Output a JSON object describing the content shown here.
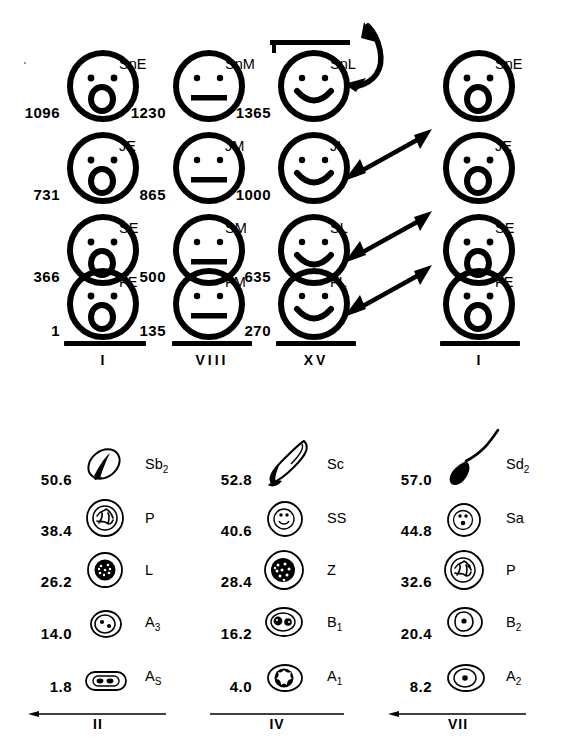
{
  "figure": {
    "top_panel": {
      "columns": [
        {
          "stage_label": "I",
          "face_style": "surprised",
          "rows": [
            {
              "number": "1096",
              "label": "SnE",
              "label_sub": ""
            },
            {
              "number": "731",
              "label": "JE",
              "label_sub": ""
            },
            {
              "number": "366",
              "label": "SE",
              "label_sub": ""
            },
            {
              "number": "1",
              "label": "FE",
              "label_sub": ""
            }
          ]
        },
        {
          "stage_label": "VIII",
          "face_style": "neutral",
          "rows": [
            {
              "number": "1230",
              "label": "SnM",
              "label_sub": ""
            },
            {
              "number": "865",
              "label": "JM",
              "label_sub": ""
            },
            {
              "number": "500",
              "label": "SM",
              "label_sub": ""
            },
            {
              "number": "135",
              "label": "FM",
              "label_sub": ""
            }
          ]
        },
        {
          "stage_label": "XV",
          "face_style": "smiling",
          "rows": [
            {
              "number": "1365",
              "label": "SnL",
              "label_sub": ""
            },
            {
              "number": "1000",
              "label": "JL",
              "label_sub": ""
            },
            {
              "number": "635",
              "label": "SL",
              "label_sub": ""
            },
            {
              "number": "270",
              "label": "FL",
              "label_sub": ""
            }
          ]
        },
        {
          "stage_label": "I",
          "face_style": "surprised",
          "rows": [
            {
              "number": "",
              "label": "SnE",
              "label_sub": ""
            },
            {
              "number": "",
              "label": "JE",
              "label_sub": ""
            },
            {
              "number": "",
              "label": "SE",
              "label_sub": ""
            },
            {
              "number": "",
              "label": "FE",
              "label_sub": ""
            }
          ]
        }
      ],
      "arrows": [
        {
          "name": "arrow-curved-snl",
          "kind": "curved-double-headed"
        },
        {
          "name": "arrow-jl",
          "kind": "straight-double-headed"
        },
        {
          "name": "arrow-sl",
          "kind": "straight-double-headed"
        },
        {
          "name": "arrow-fl",
          "kind": "straight-double-headed"
        }
      ]
    },
    "bottom_panel": {
      "columns": [
        {
          "stage_label": "II",
          "rows": [
            {
              "number": "50.6",
              "label": "Sb",
              "label_sub": "2",
              "cell": "spermatid-sb2"
            },
            {
              "number": "38.4",
              "label": "P",
              "label_sub": "",
              "cell": "pachytene"
            },
            {
              "number": "26.2",
              "label": "L",
              "label_sub": "",
              "cell": "leptotene"
            },
            {
              "number": "14.0",
              "label": "A",
              "label_sub": "3",
              "cell": "spermatogonium-a3"
            },
            {
              "number": "1.8",
              "label": "A",
              "label_sub": "S",
              "cell": "spermatogonium-as"
            }
          ]
        },
        {
          "stage_label": "IV",
          "rows": [
            {
              "number": "52.8",
              "label": "Sc",
              "label_sub": "",
              "cell": "spermatid-sc"
            },
            {
              "number": "40.6",
              "label": "SS",
              "label_sub": "",
              "cell": "secondary-spermatocyte"
            },
            {
              "number": "28.4",
              "label": "Z",
              "label_sub": "",
              "cell": "zygotene"
            },
            {
              "number": "16.2",
              "label": "B",
              "label_sub": "1",
              "cell": "spermatogonium-b1"
            },
            {
              "number": "4.0",
              "label": "A",
              "label_sub": "1",
              "cell": "spermatogonium-a1"
            }
          ]
        },
        {
          "stage_label": "VII",
          "rows": [
            {
              "number": "57.0",
              "label": "Sd",
              "label_sub": "2",
              "cell": "spermatozoon-sd2"
            },
            {
              "number": "44.8",
              "label": "Sa",
              "label_sub": "",
              "cell": "spermatid-sa"
            },
            {
              "number": "32.6",
              "label": "P",
              "label_sub": "",
              "cell": "pachytene"
            },
            {
              "number": "20.4",
              "label": "B",
              "label_sub": "2",
              "cell": "spermatogonium-b2"
            },
            {
              "number": "8.2",
              "label": "A",
              "label_sub": "2",
              "cell": "spermatogonium-a2"
            }
          ]
        }
      ]
    }
  }
}
